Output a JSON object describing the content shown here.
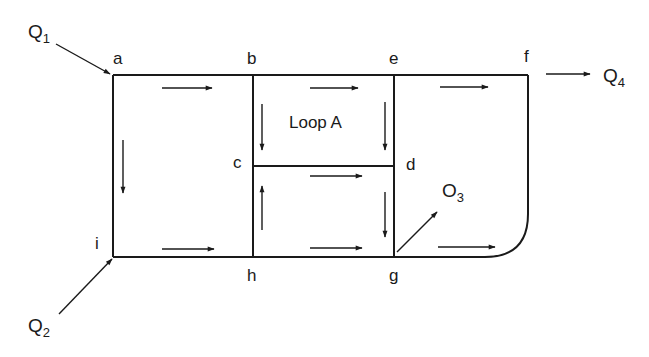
{
  "diagram": {
    "type": "pipe-network",
    "nodes": [
      {
        "id": "a",
        "label": "a"
      },
      {
        "id": "b",
        "label": "b"
      },
      {
        "id": "c",
        "label": "c"
      },
      {
        "id": "d",
        "label": "d"
      },
      {
        "id": "e",
        "label": "e"
      },
      {
        "id": "f",
        "label": "f"
      },
      {
        "id": "g",
        "label": "g"
      },
      {
        "id": "h",
        "label": "h"
      },
      {
        "id": "i",
        "label": "i"
      }
    ],
    "loop_label": "Loop A",
    "flows": [
      {
        "id": "Q1",
        "base": "Q",
        "sub": "1",
        "direction": "inflow",
        "node": "a"
      },
      {
        "id": "Q2",
        "base": "Q",
        "sub": "2",
        "direction": "inflow",
        "node": "i"
      },
      {
        "id": "Q3",
        "base": "O",
        "sub": "3",
        "direction": "outflow",
        "node": "g"
      },
      {
        "id": "Q4",
        "base": "Q",
        "sub": "4",
        "direction": "outflow",
        "node": "f"
      }
    ],
    "pipes": [
      {
        "from": "a",
        "to": "b",
        "flow_direction": "a-to-b"
      },
      {
        "from": "b",
        "to": "e",
        "flow_direction": "b-to-e"
      },
      {
        "from": "e",
        "to": "f",
        "flow_direction": "e-to-f"
      },
      {
        "from": "a",
        "to": "i",
        "flow_direction": "a-to-i"
      },
      {
        "from": "b",
        "to": "c",
        "flow_direction": "b-to-c"
      },
      {
        "from": "e",
        "to": "d",
        "flow_direction": "e-to-d"
      },
      {
        "from": "c",
        "to": "d",
        "flow_direction": "c-to-d"
      },
      {
        "from": "h",
        "to": "c",
        "flow_direction": "h-to-c"
      },
      {
        "from": "d",
        "to": "g",
        "flow_direction": "d-to-g"
      },
      {
        "from": "i",
        "to": "h",
        "flow_direction": "i-to-h"
      },
      {
        "from": "h",
        "to": "g",
        "flow_direction": "h-to-g"
      },
      {
        "from": "g",
        "to": "f",
        "flow_direction": "g-to-f"
      }
    ]
  }
}
